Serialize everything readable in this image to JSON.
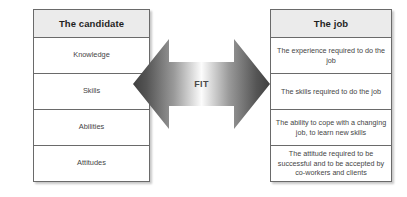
{
  "diagram": {
    "title_candidate": "The candidate",
    "title_job": "The job",
    "connector_label": "FIT",
    "colors": {
      "background": "#ffffff",
      "border": "#6a6a6a",
      "header_fill": "#ebebeb",
      "header_text": "#1f1f1f",
      "body_text": "#454545",
      "arrow_dark": "#4c4c4c",
      "arrow_light": "#fdfdfd"
    }
  },
  "candidate": {
    "header": "The candidate",
    "rows": [
      {
        "label": "Knowledge"
      },
      {
        "label": "Skills"
      },
      {
        "label": "Abilities"
      },
      {
        "label": "Attitudes"
      }
    ]
  },
  "job": {
    "header": "The job",
    "rows": [
      {
        "label": "The experience required to do the job"
      },
      {
        "label": "The skills required to do the job"
      },
      {
        "label": "The ability to cope with a changing job, to learn new skills"
      },
      {
        "label": "The attitude required to be successful and to be accepted by co-workers and clients"
      }
    ]
  }
}
